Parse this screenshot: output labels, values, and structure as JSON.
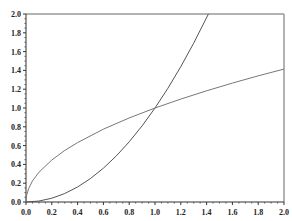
{
  "chart_data": {
    "type": "line",
    "title": "",
    "xlabel": "",
    "ylabel": "",
    "xlim": [
      0,
      2
    ],
    "ylim": [
      0,
      2
    ],
    "grid": false,
    "legend": "none",
    "x_ticks": [
      "0.0",
      "0.2",
      "0.4",
      "0.6",
      "0.8",
      "1.0",
      "1.2",
      "1.4",
      "1.6",
      "1.8",
      "2.0"
    ],
    "y_ticks": [
      "0.0",
      "0.2",
      "0.4",
      "0.6",
      "0.8",
      "1.0",
      "1.2",
      "1.4",
      "1.6",
      "1.8",
      "2.0"
    ],
    "series": [
      {
        "name": "y = x^2",
        "color": "#555555",
        "x": [
          0,
          0.1,
          0.2,
          0.3,
          0.4,
          0.5,
          0.6,
          0.7,
          0.8,
          0.9,
          1.0,
          1.1,
          1.2,
          1.3,
          1.414
        ],
        "y": [
          0,
          0.01,
          0.04,
          0.09,
          0.16,
          0.25,
          0.36,
          0.49,
          0.64,
          0.81,
          1.0,
          1.21,
          1.44,
          1.69,
          2.0
        ]
      },
      {
        "name": "y = sqrt(x)",
        "color": "#777777",
        "x": [
          0,
          0.005,
          0.02,
          0.05,
          0.1,
          0.2,
          0.3,
          0.4,
          0.6,
          0.8,
          1.0,
          1.2,
          1.4,
          1.6,
          1.8,
          2.0
        ],
        "y": [
          0,
          0.071,
          0.141,
          0.224,
          0.316,
          0.447,
          0.548,
          0.632,
          0.775,
          0.894,
          1.0,
          1.095,
          1.183,
          1.265,
          1.342,
          1.414
        ]
      }
    ]
  }
}
